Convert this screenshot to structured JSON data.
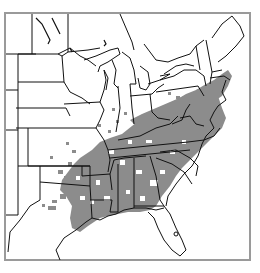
{
  "map": {
    "type": "species range map",
    "region": "Eastern United States",
    "title": "",
    "colors": {
      "range_fill": "#8c8c8c",
      "state_border": "#111111",
      "frame_border": "#9a9a9a",
      "background": "#ffffff"
    },
    "legend": [],
    "labels": []
  }
}
